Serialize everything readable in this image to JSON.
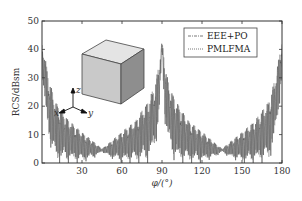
{
  "chart_data": {
    "type": "line",
    "title": "",
    "xlabel": "φ/(°)",
    "ylabel": "RCS/dBsm",
    "xlim": [
      0,
      180
    ],
    "ylim": [
      0,
      50
    ],
    "xticks": [
      30,
      60,
      90,
      120,
      150,
      180
    ],
    "yticks": [
      0,
      10,
      20,
      30,
      40,
      50
    ],
    "grid": false,
    "legend_position": "upper right",
    "series": [
      {
        "name": "EEE+PO",
        "style": "dash-dot",
        "envelope_x": [
          0,
          2,
          5,
          10,
          20,
          30,
          40,
          45,
          50,
          60,
          70,
          80,
          85,
          88,
          90,
          92,
          95,
          100,
          110,
          120,
          130,
          135,
          140,
          150,
          160,
          170,
          175,
          178,
          180
        ],
        "envelope_upper": [
          42,
          38,
          30,
          22,
          15,
          11,
          7,
          5,
          7,
          11,
          15,
          22,
          28,
          36,
          43,
          36,
          28,
          22,
          15,
          11,
          7,
          5,
          7,
          11,
          15,
          22,
          30,
          38,
          43
        ],
        "envelope_lower": [
          30,
          20,
          8,
          0,
          0,
          0,
          2,
          4,
          2,
          0,
          0,
          0,
          5,
          15,
          40,
          15,
          5,
          0,
          0,
          0,
          2,
          4,
          2,
          0,
          0,
          0,
          8,
          20,
          30
        ]
      },
      {
        "name": "PMLFMA",
        "style": "dotted",
        "envelope_x": [
          0,
          2,
          5,
          10,
          20,
          30,
          40,
          45,
          50,
          60,
          70,
          80,
          85,
          88,
          90,
          92,
          95,
          100,
          110,
          120,
          130,
          135,
          140,
          150,
          160,
          170,
          175,
          178,
          180
        ],
        "envelope_upper": [
          42,
          38,
          30,
          22,
          15,
          11,
          7,
          5,
          7,
          11,
          15,
          22,
          28,
          36,
          43,
          36,
          28,
          22,
          15,
          11,
          7,
          5,
          7,
          11,
          15,
          22,
          30,
          38,
          43
        ],
        "envelope_lower": [
          30,
          20,
          8,
          0,
          0,
          0,
          2,
          4,
          2,
          0,
          0,
          0,
          5,
          15,
          40,
          15,
          5,
          0,
          0,
          0,
          2,
          4,
          2,
          0,
          0,
          0,
          8,
          20,
          30
        ]
      }
    ],
    "annotations": [
      {
        "type": "inset-image",
        "description": "cube"
      },
      {
        "type": "axes-triad",
        "labels": [
          "x",
          "y",
          "z"
        ]
      }
    ]
  },
  "legend": {
    "items": [
      {
        "label": "EEE+PO"
      },
      {
        "label": "PMLFMA"
      }
    ]
  },
  "inset": {
    "axes": {
      "x": "x",
      "y": "y",
      "z": "z"
    }
  },
  "colors": {
    "line": "#3a3a3a",
    "axis": "#333333",
    "cube_top": "#e4e4e4",
    "cube_front": "#c9c9c9",
    "cube_side": "#8e8e8e"
  }
}
